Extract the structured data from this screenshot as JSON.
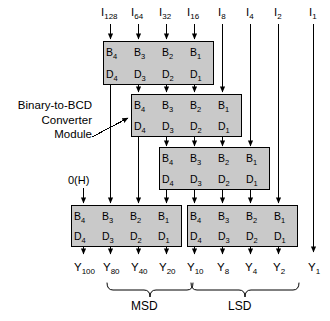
{
  "diagram": {
    "annotation": {
      "line1": "Binary-to-BCD",
      "line2": "Converter",
      "line3": "Module"
    },
    "constant_input": "0(H)",
    "box_pin_labels": {
      "inputs": [
        "B",
        "B",
        "B",
        "B"
      ],
      "input_subs": [
        "4",
        "3",
        "2",
        "1"
      ],
      "outputs": [
        "D",
        "D",
        "D",
        "D"
      ],
      "output_subs": [
        "4",
        "3",
        "2",
        "1"
      ]
    },
    "inputs": [
      {
        "name": "I",
        "sub": "128"
      },
      {
        "name": "I",
        "sub": "64"
      },
      {
        "name": "I",
        "sub": "32"
      },
      {
        "name": "I",
        "sub": "16"
      },
      {
        "name": "I",
        "sub": "8"
      },
      {
        "name": "I",
        "sub": "4"
      },
      {
        "name": "I",
        "sub": "2"
      },
      {
        "name": "I",
        "sub": "1"
      }
    ],
    "outputs": [
      {
        "name": "Y",
        "sub": "100"
      },
      {
        "name": "Y",
        "sub": "80"
      },
      {
        "name": "Y",
        "sub": "40"
      },
      {
        "name": "Y",
        "sub": "20"
      },
      {
        "name": "Y",
        "sub": "10"
      },
      {
        "name": "Y",
        "sub": "8"
      },
      {
        "name": "Y",
        "sub": "4"
      },
      {
        "name": "Y",
        "sub": "2"
      },
      {
        "name": "Y",
        "sub": "1"
      }
    ],
    "groups": [
      {
        "label": "MSD"
      },
      {
        "label": "LSD"
      }
    ],
    "modules": [
      {
        "id": "module-1"
      },
      {
        "id": "module-2"
      },
      {
        "id": "module-3"
      },
      {
        "id": "module-4"
      },
      {
        "id": "module-5"
      }
    ],
    "colors": {
      "module_fill": "#c9c9c9",
      "module_stroke": "#000000",
      "wire": "#000000",
      "background": "#ffffff"
    }
  }
}
